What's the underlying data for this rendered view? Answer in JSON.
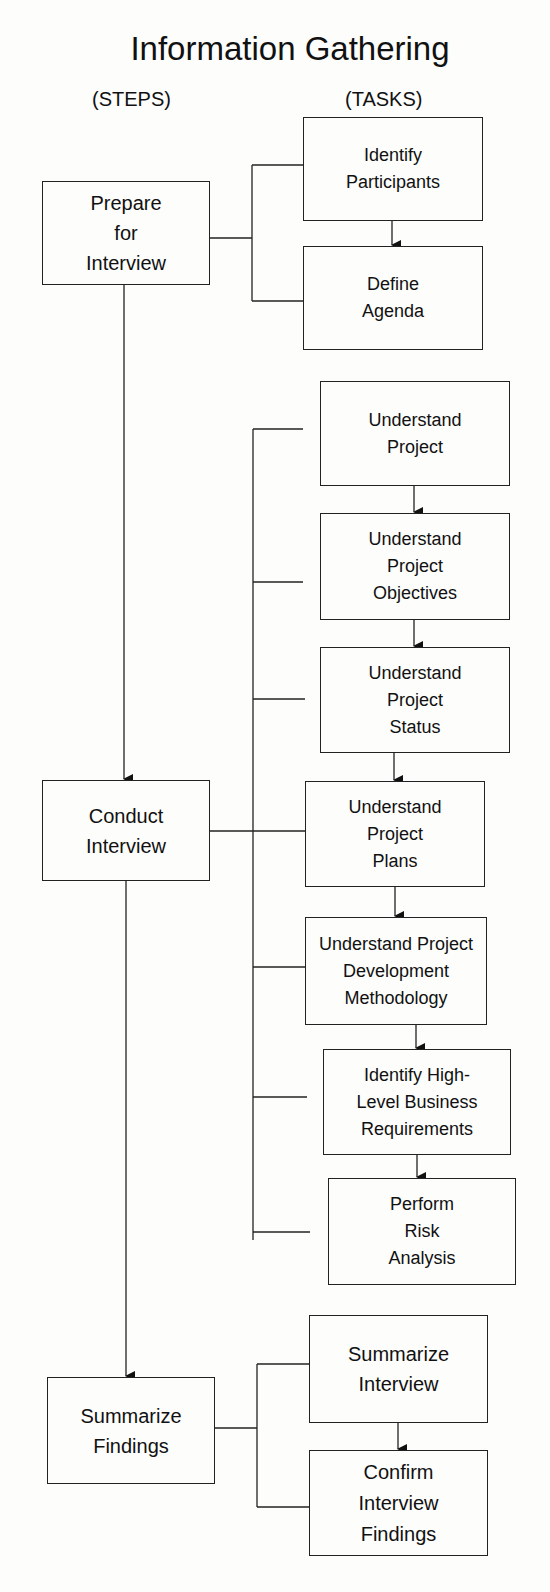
{
  "title": "Information Gathering",
  "headers": {
    "steps": "(STEPS)",
    "tasks": "(TASKS)"
  },
  "steps": [
    {
      "label": "Prepare\nfor\nInterview"
    },
    {
      "label": "Conduct\nInterview"
    },
    {
      "label": "Summarize\nFindings"
    }
  ],
  "tasks": [
    {
      "label": "Identify\nParticipants",
      "step": 0
    },
    {
      "label": "Define\nAgenda",
      "step": 0
    },
    {
      "label": "Understand\nProject",
      "step": 1
    },
    {
      "label": "Understand\nProject\nObjectives",
      "step": 1
    },
    {
      "label": "Understand\nProject\nStatus",
      "step": 1
    },
    {
      "label": "Understand\nProject\nPlans",
      "step": 1
    },
    {
      "label": "Understand Project\nDevelopment\nMethodology",
      "step": 1
    },
    {
      "label": "Identify High-\nLevel Business\nRequirements",
      "step": 1
    },
    {
      "label": "Perform\nRisk\nAnalysis",
      "step": 1
    },
    {
      "label": "Summarize\nInterview",
      "step": 2
    },
    {
      "label": "Confirm\nInterview\nFindings",
      "step": 2
    }
  ]
}
